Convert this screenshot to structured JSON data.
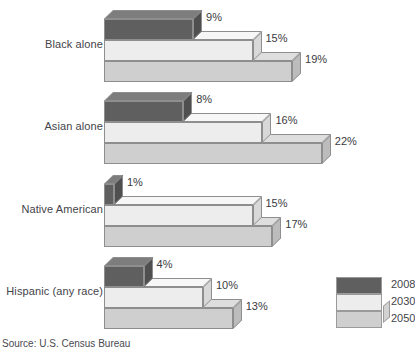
{
  "chart_data": {
    "type": "bar",
    "title": "",
    "xlabel": "",
    "ylabel": "",
    "orientation": "horizontal",
    "style": "3d-stepped",
    "grid": false,
    "legend_position": "bottom-right",
    "unit": "%",
    "xlim": [
      0,
      24
    ],
    "categories": [
      "Black alone",
      "Asian alone",
      "Native American",
      "Hispanic (any race)"
    ],
    "series": [
      {
        "name": "2008",
        "color": "#6f6f6f",
        "values": [
          9,
          8,
          1,
          4
        ],
        "labels": [
          "9%",
          "8%",
          "1%",
          "4%"
        ]
      },
      {
        "name": "2030",
        "color": "#ededed",
        "values": [
          15,
          16,
          15,
          10
        ],
        "labels": [
          "15%",
          "16%",
          "15%",
          "10%"
        ]
      },
      {
        "name": "2050",
        "color": "#cfcfcf",
        "values": [
          19,
          22,
          17,
          13
        ],
        "labels": [
          "19%",
          "17%",
          "17%",
          "13%"
        ]
      }
    ],
    "source": "Source: U.S. Census Bureau"
  },
  "legend": {
    "items": [
      {
        "label": "2008"
      },
      {
        "label": "2030"
      },
      {
        "label": "2050"
      }
    ]
  },
  "groups": [
    {
      "label": "Black alone",
      "bars": [
        {
          "series": "2008",
          "value": 9,
          "label": "9%"
        },
        {
          "series": "2030",
          "value": 15,
          "label": "15%"
        },
        {
          "series": "2050",
          "value": 19,
          "label": "19%"
        }
      ]
    },
    {
      "label": "Asian alone",
      "bars": [
        {
          "series": "2008",
          "value": 8,
          "label": "8%"
        },
        {
          "series": "2030",
          "value": 16,
          "label": "16%"
        },
        {
          "series": "2050",
          "value": 22,
          "label": "22%"
        }
      ]
    },
    {
      "label": "Native American",
      "bars": [
        {
          "series": "2008",
          "value": 1,
          "label": "1%"
        },
        {
          "series": "2030",
          "value": 15,
          "label": "15%"
        },
        {
          "series": "2050",
          "value": 17,
          "label": "17%"
        }
      ]
    },
    {
      "label": "Hispanic (any race)",
      "bars": [
        {
          "series": "2008",
          "value": 4,
          "label": "4%"
        },
        {
          "series": "2030",
          "value": 10,
          "label": "10%"
        },
        {
          "series": "2050",
          "value": 13,
          "label": "13%"
        }
      ]
    }
  ],
  "colors": {
    "series_2008_front": "#5f5f5f",
    "series_2008_top": "#7d7d7d",
    "series_2008_side": "#4f4f4f",
    "series_2030_front": "#ededed",
    "series_2030_top": "#f7f7f7",
    "series_2030_side": "#d8d8d8",
    "series_2050_front": "#cfcfcf",
    "series_2050_top": "#dedede",
    "series_2050_side": "#bcbcbc",
    "outline": "#8e8e8e",
    "text": "#44444a"
  },
  "footer": {
    "source": "Source: U.S. Census Bureau"
  }
}
